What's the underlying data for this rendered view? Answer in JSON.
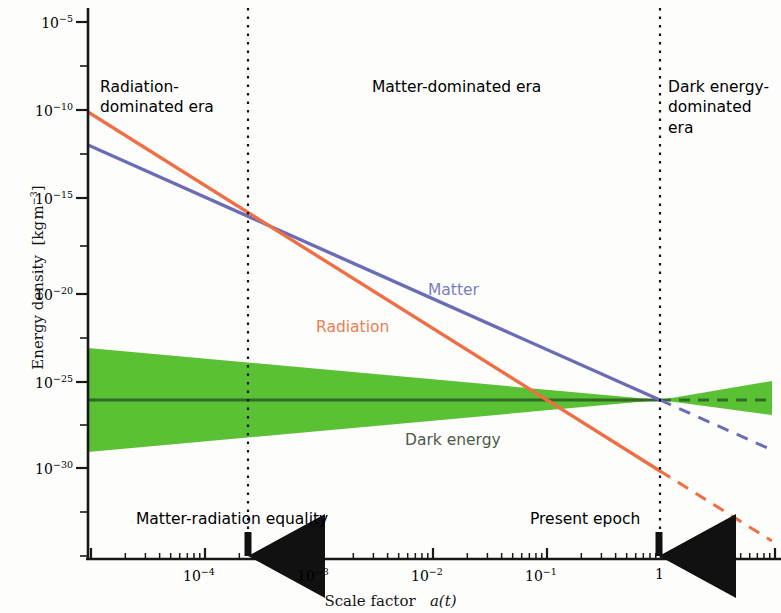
{
  "figure": {
    "background": "#fdfdfc",
    "plot_area": {
      "left": 88,
      "right": 772,
      "top": 10,
      "bottom": 560
    }
  },
  "axes": {
    "x": {
      "title": "Scale factor",
      "title_var": "a(t)",
      "ticks": [
        {
          "label_base": "10",
          "label_exp": "−4",
          "value": -4,
          "x": 205
        },
        {
          "label_base": "10",
          "label_exp": "−3",
          "value": -3,
          "x": 319
        },
        {
          "label_base": "10",
          "label_exp": "−2",
          "value": -2,
          "x": 433
        },
        {
          "label_base": "10",
          "label_exp": "−1",
          "value": -1,
          "x": 547
        },
        {
          "label_base": "1",
          "label_exp": "",
          "value": 0,
          "x": 661
        }
      ],
      "range_log10": [
        -5.1,
        1.0
      ]
    },
    "y": {
      "title": "Energy density",
      "title_units": "[kg m−3]",
      "title_full": "Energy density  [kg m⁻³]",
      "ticks": [
        {
          "label_base": "10",
          "label_exp": "−5",
          "value": -5,
          "y": 22
        },
        {
          "label_base": "10",
          "label_exp": "−10",
          "value": -10,
          "y": 110
        },
        {
          "label_base": "10",
          "label_exp": "−15",
          "value": -15,
          "y": 198
        },
        {
          "label_base": "10",
          "label_exp": "−20",
          "value": -20,
          "y": 294
        },
        {
          "label_base": "10",
          "label_exp": "−25",
          "value": -25,
          "y": 382
        },
        {
          "label_base": "10",
          "label_exp": "−30",
          "value": -30,
          "y": 468
        }
      ],
      "range_log10": [
        -32.5,
        -3.8
      ]
    }
  },
  "eras": [
    {
      "name": "radiation-era",
      "lines": [
        "Radiation-",
        "dominated era"
      ],
      "x": 100,
      "y": 88
    },
    {
      "name": "matter-era",
      "lines": [
        "Matter-dominated era"
      ],
      "x": 372,
      "y": 88
    },
    {
      "name": "dark-energy-era",
      "lines": [
        "Dark energy-",
        "dominated",
        "era"
      ],
      "x": 656,
      "y": 88
    }
  ],
  "dividers": [
    {
      "name": "matter-radiation-equality-line",
      "x": 248
    },
    {
      "name": "present-epoch-line",
      "x": 660
    }
  ],
  "events": [
    {
      "name": "matter-radiation-equality",
      "label": "Matter-radiation equality",
      "label_x": 136,
      "label_y": 521,
      "arrow_x": 248
    },
    {
      "name": "present-epoch",
      "label": "Present epoch",
      "label_x": 530,
      "label_y": 521,
      "arrow_x": 659
    }
  ],
  "curve_labels": [
    {
      "name": "matter-label",
      "text": "Matter",
      "x": 428,
      "y": 293,
      "color": "#7b7fbe"
    },
    {
      "name": "radiation-label",
      "text": "Radiation",
      "x": 316,
      "y": 330,
      "color": "#ea7d52"
    },
    {
      "name": "dark-energy-label",
      "text": "Dark energy",
      "x": 405,
      "y": 443,
      "color": "#4d5a4a"
    }
  ],
  "colors": {
    "radiation": "#ef6f45",
    "matter": "#6a6cb5",
    "dark_energy_band": "#5bc134",
    "dark_energy_line": "#2e6b24",
    "axis": "#181818",
    "background": "#fdfdfc"
  },
  "chart_data": {
    "type": "line",
    "title": "",
    "xlabel": "Scale factor a(t)",
    "ylabel": "Energy density [kg m^-3]",
    "x_scale": "log",
    "y_scale": "log",
    "xlim": [
      7.9e-06,
      10
    ],
    "ylim": [
      3.2e-33,
      0.00016
    ],
    "grid": false,
    "legend": "inline-annotations",
    "xtick_labels": [
      "10^-4",
      "10^-3",
      "10^-2",
      "10^-1",
      "1"
    ],
    "ytick_labels": [
      "10^-5",
      "10^-10",
      "10^-15",
      "10^-20",
      "10^-25",
      "10^-30"
    ],
    "series": [
      {
        "name": "Radiation",
        "color": "#ef6f45",
        "slope_loglog": -4,
        "solid_points": [
          {
            "x_log10": -5.1,
            "y_log10": -10.12
          },
          {
            "x_log10": 0.0,
            "y_log10": -30.52
          }
        ],
        "dashed_points": [
          {
            "x_log10": 0.0,
            "y_log10": -30.52
          },
          {
            "x_log10": 1.0,
            "y_log10": -34.52
          }
        ]
      },
      {
        "name": "Matter",
        "color": "#6a6cb5",
        "slope_loglog": -3,
        "solid_points": [
          {
            "x_log10": -5.1,
            "y_log10": -11.99
          },
          {
            "x_log10": 0.0,
            "y_log10": -26.69
          }
        ],
        "dashed_points": [
          {
            "x_log10": 0.0,
            "y_log10": -26.69
          },
          {
            "x_log10": 1.0,
            "y_log10": -29.69
          }
        ]
      },
      {
        "name": "Dark energy",
        "color": "#2e6b24",
        "slope_loglog": 0,
        "solid_points": [
          {
            "x_log10": -5.1,
            "y_log10": -26.69
          },
          {
            "x_log10": 0.0,
            "y_log10": -26.69
          }
        ],
        "dashed_points": [
          {
            "x_log10": 0.0,
            "y_log10": -26.69
          },
          {
            "x_log10": 1.0,
            "y_log10": -26.69
          }
        ],
        "uncertainty_band": {
          "color": "#5bc134",
          "left_upper_y_log10": -23.7,
          "left_lower_y_log10": -29.6,
          "at_present_upper_y_log10": -26.69,
          "at_present_lower_y_log10": -26.69,
          "right_upper_y_log10": -26.0,
          "right_lower_y_log10": -27.4
        }
      }
    ],
    "annotations": [
      {
        "text": "Radiation-dominated era",
        "x_log10": -4.6,
        "region": "left"
      },
      {
        "text": "Matter-dominated era",
        "x_log10": -2.2,
        "region": "middle"
      },
      {
        "text": "Dark energy-dominated era",
        "x_log10": 0.2,
        "region": "right"
      },
      {
        "text": "Matter-radiation equality",
        "x_log10": -3.62,
        "type": "arrow-marker"
      },
      {
        "text": "Present epoch",
        "x_log10": 0.0,
        "type": "arrow-marker"
      }
    ]
  }
}
